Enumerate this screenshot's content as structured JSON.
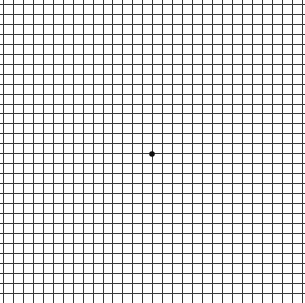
{
  "diagram": {
    "type": "amsler-grid",
    "background": "#ffffff",
    "line_color": "#3a3a3a",
    "dot_color": "#111111",
    "grid": {
      "origin_x": 3,
      "origin_y": 4,
      "cell_size": 9.95,
      "columns": 30,
      "rows": 30,
      "line_width": 1
    },
    "center_dot": {
      "cx": 152,
      "cy": 154,
      "r": 2.8
    }
  }
}
